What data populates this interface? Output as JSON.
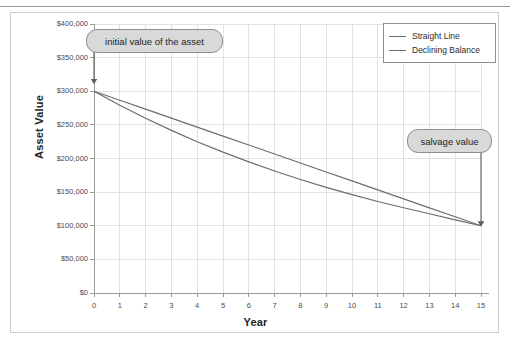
{
  "document": {
    "top_strip_text": ""
  },
  "chart_data": {
    "type": "line",
    "title": "",
    "xlabel": "Year",
    "ylabel": "Asset Value",
    "xlim": [
      0,
      15
    ],
    "ylim": [
      0,
      400000
    ],
    "grid": true,
    "legend_position": "top-right",
    "x": [
      0,
      1,
      2,
      3,
      4,
      5,
      6,
      7,
      8,
      9,
      10,
      11,
      12,
      13,
      14,
      15
    ],
    "xtick_labels": [
      "0",
      "1",
      "2",
      "3",
      "4",
      "5",
      "6",
      "7",
      "8",
      "9",
      "10",
      "11",
      "12",
      "13",
      "14",
      "15"
    ],
    "ytick_values": [
      0,
      50000,
      100000,
      150000,
      200000,
      250000,
      300000,
      350000,
      400000
    ],
    "ytick_labels": [
      "$0",
      "$50,000",
      "$100,000",
      "$150,000",
      "$200,000",
      "$250,000",
      "$300,000",
      "$350,000",
      "$400,000"
    ],
    "series": [
      {
        "name": "Straight Line",
        "color": "#6d6d6d",
        "values": [
          300000,
          286667,
          273333,
          260000,
          246667,
          233333,
          220000,
          206667,
          193333,
          180000,
          166667,
          153333,
          140000,
          126667,
          113333,
          100000
        ]
      },
      {
        "name": "Declining Balance",
        "color": "#6d6d6d",
        "values": [
          300000,
          279200,
          259800,
          241800,
          225000,
          209400,
          194900,
          181400,
          168800,
          157100,
          146200,
          136100,
          126700,
          117900,
          108700,
          100000
        ]
      }
    ],
    "annotations": [
      {
        "name": "initial-value-callout",
        "label": "initial value of the asset",
        "points_to_x": 0,
        "points_to_y": 300000
      },
      {
        "name": "salvage-value-callout",
        "label": "salvage value",
        "points_to_x": 15,
        "points_to_y": 100000
      }
    ]
  }
}
